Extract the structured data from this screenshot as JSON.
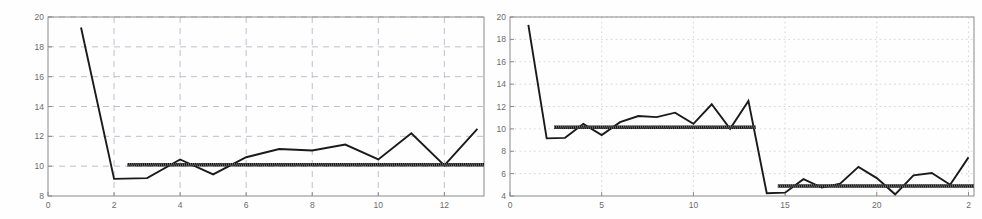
{
  "figure": {
    "name": "two-panel-convergence-plot",
    "background_color": "#fefefe",
    "line_color": "#1a1a1a",
    "grid_color": "#b9b9c6",
    "axis_color": "#8a8a8a"
  },
  "chart_data": [
    {
      "panel": "left",
      "type": "line",
      "title": "",
      "subtitle": "",
      "xlabel": "",
      "ylabel": "",
      "xlim": [
        0,
        13.2
      ],
      "ylim": [
        8,
        20
      ],
      "xticks": [
        0,
        2,
        4,
        6,
        8,
        10,
        12
      ],
      "yticks": [
        8,
        10,
        12,
        14,
        16,
        18,
        20
      ],
      "xtick_labels": [
        "0",
        "2",
        "4",
        "6",
        "8",
        "10",
        "12"
      ],
      "ytick_labels": [
        "8",
        "10",
        "12",
        "14",
        "16",
        "18",
        "20"
      ],
      "grid": true,
      "grid_style": "dashed",
      "legend": false,
      "legend_position": "none",
      "series": [
        {
          "name": "estimate",
          "style": "solid-line",
          "color": "#1a1a1a",
          "x": [
            1,
            2,
            3,
            4,
            5,
            6,
            7,
            8,
            9,
            10,
            11,
            12,
            13
          ],
          "y": [
            19.3,
            9.15,
            9.2,
            10.45,
            9.45,
            10.6,
            11.15,
            11.05,
            11.45,
            10.45,
            12.2,
            10.05,
            12.5
          ]
        },
        {
          "name": "reference-level",
          "style": "thick-horizontal-band",
          "color": "#111111",
          "x": [
            2.4,
            13.2
          ],
          "y": [
            10.1,
            10.1
          ],
          "value": 10.1
        }
      ]
    },
    {
      "panel": "right",
      "type": "line",
      "title": "",
      "subtitle": "",
      "xlabel": "",
      "ylabel": "",
      "xlim": [
        0,
        25.3
      ],
      "ylim": [
        4,
        20
      ],
      "xticks": [
        0,
        5,
        10,
        15,
        20,
        25
      ],
      "yticks": [
        4,
        6,
        8,
        10,
        12,
        14,
        16,
        18,
        20
      ],
      "xtick_labels": [
        "0",
        "5",
        "10",
        "15",
        "20",
        "2"
      ],
      "ytick_labels": [
        "4",
        "6",
        "8",
        "10",
        "12",
        "14",
        "16",
        "18",
        "20"
      ],
      "grid": true,
      "grid_style": "dotted",
      "legend": false,
      "legend_position": "none",
      "series": [
        {
          "name": "estimate",
          "style": "solid-line",
          "color": "#1a1a1a",
          "x": [
            1,
            2,
            3,
            4,
            5,
            6,
            7,
            8,
            9,
            10,
            11,
            12,
            13,
            14,
            15,
            16,
            17,
            18,
            19,
            20,
            21,
            22,
            23,
            24,
            25
          ],
          "y": [
            19.3,
            9.15,
            9.2,
            10.45,
            9.45,
            10.6,
            11.15,
            11.05,
            11.45,
            10.45,
            12.2,
            10.0,
            12.5,
            4.25,
            4.3,
            5.5,
            4.75,
            5.1,
            6.6,
            5.6,
            4.15,
            5.85,
            6.05,
            5.0,
            7.45
          ]
        },
        {
          "name": "reference-level-high",
          "style": "thick-horizontal-band",
          "color": "#111111",
          "x": [
            2.4,
            13.4
          ],
          "y": [
            10.15,
            10.15
          ],
          "value": 10.15
        },
        {
          "name": "reference-level-low",
          "style": "thick-horizontal-band",
          "color": "#111111",
          "x": [
            14.6,
            25.3
          ],
          "y": [
            4.9,
            4.9
          ],
          "value": 4.9
        }
      ]
    }
  ]
}
